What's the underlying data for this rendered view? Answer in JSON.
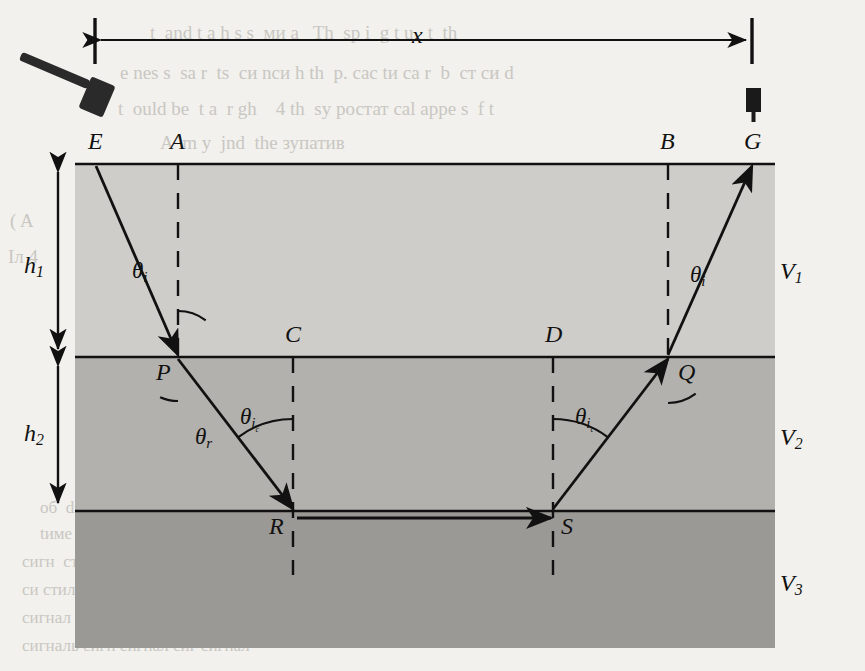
{
  "figure": {
    "distance_label": "x",
    "source_icon": "sledgehammer-icon",
    "receiver_icon": "geophone-icon",
    "surface_points": [
      {
        "id": "E",
        "label": "E",
        "x": 96,
        "y": 164,
        "role": "shot-point"
      },
      {
        "id": "A",
        "label": "A",
        "x": 178,
        "y": 164,
        "role": "normal-foot"
      },
      {
        "id": "B",
        "label": "B",
        "x": 668,
        "y": 164,
        "role": "normal-foot"
      },
      {
        "id": "G",
        "label": "G",
        "x": 752,
        "y": 164,
        "role": "geophone-point"
      }
    ],
    "interface1_points": [
      {
        "id": "P",
        "label": "P",
        "x": 178,
        "y": 357,
        "role": "refraction-point"
      },
      {
        "id": "C",
        "label": "C",
        "x": 293,
        "y": 357,
        "role": "normal-foot"
      },
      {
        "id": "D",
        "label": "D",
        "x": 553,
        "y": 357,
        "role": "normal-foot"
      },
      {
        "id": "Q",
        "label": "Q",
        "x": 668,
        "y": 357,
        "role": "refraction-point"
      }
    ],
    "interface2_points": [
      {
        "id": "R",
        "label": "R",
        "x": 293,
        "y": 511,
        "role": "critical-refraction-point"
      },
      {
        "id": "S",
        "label": "S",
        "x": 553,
        "y": 511,
        "role": "critical-refraction-point"
      }
    ],
    "angles": [
      {
        "id": "theta-i-left",
        "base": "θ",
        "sub": "i",
        "sub2": "",
        "x": 132,
        "y": 258,
        "at_point": "P",
        "layer": "V1"
      },
      {
        "id": "theta-i-right",
        "base": "θ",
        "sub": "i",
        "sub2": "",
        "x": 690,
        "y": 262,
        "at_point": "Q",
        "layer": "V1"
      },
      {
        "id": "theta-r",
        "base": "θ",
        "sub": "r",
        "sub2": "",
        "x": 195,
        "y": 424,
        "at_point": "P",
        "layer": "V2"
      },
      {
        "id": "theta-ic-left",
        "base": "θ",
        "sub": "i",
        "sub2": "c",
        "x": 240,
        "y": 404,
        "at_point": "R",
        "layer": "V2"
      },
      {
        "id": "theta-ic-right",
        "base": "θ",
        "sub": "i",
        "sub2": "c",
        "x": 575,
        "y": 404,
        "at_point": "S",
        "layer": "V2"
      }
    ],
    "velocities": [
      {
        "id": "V1",
        "base": "V",
        "sub": "1",
        "x": 780,
        "y": 258,
        "layer": "top"
      },
      {
        "id": "V2",
        "base": "V",
        "sub": "2",
        "x": 780,
        "y": 424,
        "layer": "middle"
      },
      {
        "id": "V3",
        "base": "V",
        "sub": "3",
        "x": 780,
        "y": 570,
        "layer": "bottom"
      }
    ],
    "thicknesses": [
      {
        "id": "h1",
        "base": "h",
        "sub": "1",
        "x": 24,
        "y": 252,
        "from_y": 166,
        "to_y": 355
      },
      {
        "id": "h2",
        "base": "h",
        "sub": "2",
        "x": 24,
        "y": 420,
        "from_y": 360,
        "to_y": 509
      }
    ],
    "layers": [
      {
        "id": "layer-1",
        "velocity": "V1",
        "fill": "#cfcdc9",
        "top": 164,
        "bottom": 357
      },
      {
        "id": "layer-2",
        "velocity": "V2",
        "fill": "#b3b1ad",
        "top": 357,
        "bottom": 511
      },
      {
        "id": "layer-3",
        "velocity": "V3",
        "fill": "#9b9995",
        "top": 511,
        "bottom": 648
      }
    ],
    "raypath": {
      "id": "refraction-raypath",
      "segments": [
        {
          "from": "E",
          "to": "P",
          "x1": 96,
          "y1": 166,
          "x2": 178,
          "y2": 355,
          "layer": "V1",
          "arrow": true
        },
        {
          "from": "P",
          "to": "R",
          "x1": 178,
          "y1": 359,
          "x2": 293,
          "y2": 509,
          "layer": "V2",
          "arrow": true
        },
        {
          "from": "R",
          "to": "S",
          "x1": 297,
          "y1": 518,
          "x2": 551,
          "y2": 518,
          "layer": "interface2",
          "arrow": true
        },
        {
          "from": "S",
          "to": "Q",
          "x1": 553,
          "y1": 509,
          "x2": 668,
          "y2": 359,
          "layer": "V2",
          "arrow": true
        },
        {
          "from": "Q",
          "to": "G",
          "x1": 668,
          "y1": 355,
          "x2": 752,
          "y2": 166,
          "layer": "V1",
          "arrow": true
        }
      ]
    },
    "dashed_normals": [
      {
        "id": "normal-A",
        "x": 178,
        "y1": 164,
        "y2": 357
      },
      {
        "id": "normal-C",
        "x": 293,
        "y1": 357,
        "y2": 575
      },
      {
        "id": "normal-D",
        "x": 553,
        "y1": 357,
        "y2": 575
      },
      {
        "id": "normal-B",
        "x": 668,
        "y1": 164,
        "y2": 357
      }
    ],
    "distance_arrow": {
      "id": "x-dimension",
      "x1": 95,
      "x2": 752,
      "y": 40,
      "tick_top": 18,
      "tick_bottom": 64
    }
  },
  "background_text": {
    "note": "faint show-through text from reverse page",
    "lines": [
      {
        "t": "t  and t a h s s  ми a   Th  sp i  g t u   t  th",
        "x": 150,
        "y": 22,
        "size": 19
      },
      {
        "t": "e nes s  sа r  ts  си nси h th  p. cас tи са r  b  ст си d",
        "x": 120,
        "y": 62,
        "size": 19
      },
      {
        "t": "t  ould be  t a  r gh    4 th  sу ростат cal арре s  f t",
        "x": 118,
        "y": 98,
        "size": 19
      },
      {
        "t": "A  m y  jnd  the зупатив",
        "x": 160,
        "y": 132,
        "size": 19
      },
      {
        "t": "the  соитанс  ста  t си ти  тин  сте си  cер статес | AШ",
        "x": 150,
        "y": 198,
        "size": 19
      },
      {
        "t": "h  будет маст  sу b корня  ст сре  стилл си  спесии мие сигнал",
        "x": 146,
        "y": 228,
        "size": 19
      },
      {
        "t": "m   Рестер 4 в идея a  tим now имп ис t bе tак си сивили",
        "x": 150,
        "y": 258,
        "size": 19
      },
      {
        "t": "TWO-DIMENSIONAL SHELTER",
        "x": 330,
        "y": 405,
        "size": 30
      },
      {
        "t": "TE   Lи   Rам  си св сигнал",
        "x": 170,
        "y": 455,
        "size": 22
      },
      {
        "t": "об  dи d  раз ум тинас  a  eст  сис  tак ест сиг  сигна сигн",
        "x": 40,
        "y": 498,
        "size": 17
      },
      {
        "t": "tиме  се нас син тин си станс ест  tак сигнал си стил",
        "x": 40,
        "y": 524,
        "size": 17
      },
      {
        "t": "сигн  стил сиг тин си станс тим сиг сигнал",
        "x": 22,
        "y": 552,
        "size": 17
      },
      {
        "t": "cи стилл сигн си тина сигнал сиг сигналь",
        "x": 22,
        "y": 580,
        "size": 17
      },
      {
        "t": "сигнал си тим сигн сигнал сигн сигнала",
        "x": 22,
        "y": 608,
        "size": 17
      },
      {
        "t": "сигналь сигн сигнал сиг сигнал",
        "x": 22,
        "y": 636,
        "size": 17
      },
      {
        "t": "( A",
        "x": 10,
        "y": 210,
        "size": 19
      },
      {
        "t": "Iл 4",
        "x": 8,
        "y": 246,
        "size": 19
      }
    ]
  },
  "colors": {
    "page_background": "#f2f1ee",
    "layer1_fill": "#cfcdc9",
    "layer2_fill": "#b3b1ad",
    "layer3_fill": "#9b9995",
    "ink": "#111111",
    "showthrough_text": "#c9c7c2"
  }
}
